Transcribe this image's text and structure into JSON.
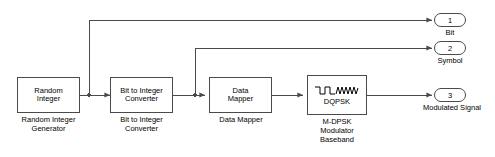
{
  "diagram": {
    "background_color": "#ffffff",
    "line_color": "#4a4a4a"
  },
  "blocks": [
    {
      "id": "random-integer",
      "inner_label": "Random\nInteger",
      "caption": "Random Integer\nGenerator"
    },
    {
      "id": "bit-to-integer-converter",
      "inner_label": "Bit to Integer\nConverter",
      "caption": "Bit to Integer\nConverter"
    },
    {
      "id": "data-mapper",
      "inner_label": "Data\nMapper",
      "caption": "Data Mapper"
    },
    {
      "id": "m-dpsk-modulator",
      "inner_label": "DQPSK",
      "icon": "square-to-sine-wave-icon",
      "caption": "M-DPSK\nModulator\nBaseband"
    }
  ],
  "ports": [
    {
      "id": "port-bit",
      "number": "1",
      "caption": "Bit"
    },
    {
      "id": "port-symbol",
      "number": "2",
      "caption": "Symbol"
    },
    {
      "id": "port-modulated-signal",
      "number": "3",
      "caption": "Modulated Signal"
    }
  ]
}
